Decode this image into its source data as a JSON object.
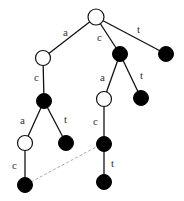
{
  "diagram": {
    "type": "trie",
    "nodes": [
      {
        "id": "root",
        "x": 96,
        "y": 17,
        "fill": "white"
      },
      {
        "id": "n_a",
        "x": 43,
        "y": 58,
        "fill": "white"
      },
      {
        "id": "n_c",
        "x": 120,
        "y": 54,
        "fill": "black"
      },
      {
        "id": "n_t",
        "x": 166,
        "y": 54,
        "fill": "black"
      },
      {
        "id": "n_ac",
        "x": 44,
        "y": 101,
        "fill": "black"
      },
      {
        "id": "n_ca",
        "x": 104,
        "y": 99,
        "fill": "white"
      },
      {
        "id": "n_ct",
        "x": 141,
        "y": 98,
        "fill": "black"
      },
      {
        "id": "n_aca",
        "x": 25,
        "y": 143,
        "fill": "white"
      },
      {
        "id": "n_act",
        "x": 66,
        "y": 143,
        "fill": "black"
      },
      {
        "id": "n_cac",
        "x": 104,
        "y": 144,
        "fill": "black"
      },
      {
        "id": "n_acac",
        "x": 25,
        "y": 185,
        "fill": "black"
      },
      {
        "id": "n_cact",
        "x": 104,
        "y": 182,
        "fill": "black"
      }
    ],
    "edges": [
      {
        "from": "root",
        "to": "n_a",
        "label": "a",
        "lx": 63,
        "ly": 27
      },
      {
        "from": "root",
        "to": "n_c",
        "label": "c",
        "lx": 97,
        "ly": 32
      },
      {
        "from": "root",
        "to": "n_t",
        "label": "t",
        "lx": 137,
        "ly": 24
      },
      {
        "from": "n_a",
        "to": "n_ac",
        "label": "c",
        "lx": 34,
        "ly": 72
      },
      {
        "from": "n_c",
        "to": "n_ca",
        "label": "a",
        "lx": 100,
        "ly": 72
      },
      {
        "from": "n_c",
        "to": "n_ct",
        "label": "t",
        "lx": 140,
        "ly": 70
      },
      {
        "from": "n_ac",
        "to": "n_aca",
        "label": "a",
        "lx": 20,
        "ly": 115
      },
      {
        "from": "n_ac",
        "to": "n_act",
        "label": "t",
        "lx": 64,
        "ly": 114
      },
      {
        "from": "n_ca",
        "to": "n_cac",
        "label": "c",
        "lx": 93,
        "ly": 116
      },
      {
        "from": "n_aca",
        "to": "n_acac",
        "label": "c",
        "lx": 12,
        "ly": 160
      },
      {
        "from": "n_cac",
        "to": "n_cact",
        "label": "t",
        "lx": 111,
        "ly": 158
      }
    ],
    "links": [
      {
        "from": "n_acac",
        "to": "n_cac",
        "style": "dashed"
      }
    ]
  }
}
